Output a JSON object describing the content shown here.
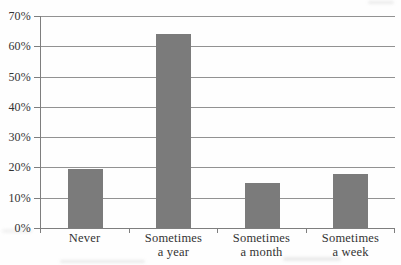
{
  "chart_data": {
    "type": "bar",
    "title": "",
    "xlabel": "",
    "ylabel": "",
    "categories": [
      "Never",
      "Sometimes a year",
      "Sometimes a month",
      "Sometimes a week"
    ],
    "category_lines": [
      [
        "Never"
      ],
      [
        "Sometimes",
        "a year"
      ],
      [
        "Sometimes",
        "a month"
      ],
      [
        "Sometimes",
        "a week"
      ]
    ],
    "values": [
      19.5,
      63.9,
      15,
      17.8
    ],
    "ylim": [
      0,
      70
    ],
    "ytick_step": 10,
    "ytick_labels": [
      "0%",
      "10%",
      "20%",
      "30%",
      "40%",
      "50%",
      "60%",
      "70%"
    ],
    "grid": true,
    "legend": false,
    "bar_color": "#7b7b7b",
    "grid_color": "#929292",
    "axis_color": "#7e7e7e",
    "text_color": "#333333"
  }
}
